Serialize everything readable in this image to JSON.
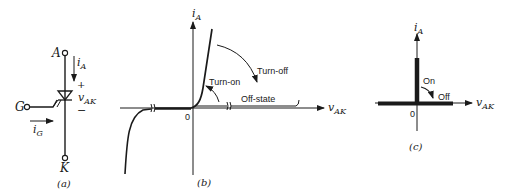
{
  "panel_a": {
    "caption": "(a)",
    "terminal_anode": "A",
    "terminal_cathode": "K",
    "terminal_gate": "G",
    "anode_current": "i",
    "anode_current_sub": "A",
    "gate_current": "i",
    "gate_current_sub": "G",
    "voltage": "v",
    "voltage_sub": "AK",
    "plus": "+",
    "minus": "−"
  },
  "panel_b": {
    "caption": "(b)",
    "y_axis_label": "i",
    "y_axis_sub": "A",
    "x_axis_label": "v",
    "x_axis_sub": "AK",
    "origin": "0",
    "label_turn_on": "Turn-on",
    "label_turn_off": "Turn-off",
    "label_off_state": "Off-state"
  },
  "panel_c": {
    "caption": "(c)",
    "y_axis_label": "i",
    "y_axis_sub": "A",
    "x_axis_label": "v",
    "x_axis_sub": "AK",
    "origin": "0",
    "label_on": "On",
    "label_off": "Off"
  }
}
